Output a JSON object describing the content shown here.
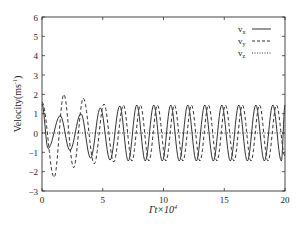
{
  "chart_data": {
    "type": "line",
    "title": "",
    "xlabel": "Γt×10⁴",
    "ylabel": "Velocity(ms⁻¹)",
    "xlim": [
      0,
      20
    ],
    "ylim": [
      -3,
      6
    ],
    "x_ticks": [
      "0",
      "5",
      "10",
      "15",
      "20"
    ],
    "y_ticks": [
      "-3",
      "-2",
      "-1",
      "0",
      "1",
      "2",
      "3",
      "4",
      "5",
      "6"
    ],
    "grid": false,
    "legend_position": "upper right",
    "series": [
      {
        "name": "vx",
        "style": "solid",
        "description": "oscillation starting ~1.5, early amplitude ~0.9, growing to ~1.45, period ~1.35",
        "points": [
          [
            0,
            1.5
          ],
          [
            0.5,
            -0.8
          ],
          [
            1.5,
            0.9
          ],
          [
            2.3,
            -0.9
          ],
          [
            3.2,
            1.0
          ],
          [
            4.0,
            -1.3
          ],
          [
            4.8,
            1.3
          ],
          [
            5.6,
            -1.4
          ],
          [
            6.4,
            1.4
          ],
          [
            7.1,
            -1.45
          ],
          [
            7.8,
            1.45
          ],
          [
            8.5,
            -1.45
          ],
          [
            9.2,
            1.45
          ],
          [
            9.9,
            -1.45
          ],
          [
            10.6,
            1.45
          ],
          [
            11.3,
            -1.45
          ],
          [
            12.0,
            1.45
          ],
          [
            12.7,
            -1.45
          ],
          [
            13.4,
            1.45
          ],
          [
            14.1,
            -1.45
          ],
          [
            14.8,
            1.45
          ],
          [
            15.5,
            -1.45
          ],
          [
            16.2,
            1.45
          ],
          [
            16.9,
            -1.45
          ],
          [
            17.6,
            1.45
          ],
          [
            18.3,
            -1.45
          ],
          [
            19.0,
            1.45
          ],
          [
            19.7,
            -1.45
          ],
          [
            20,
            1.45
          ]
        ]
      },
      {
        "name": "vy",
        "style": "dashed",
        "description": "starts ~1.6, large early swings (-2.3 / 2.0), settles to ~1.45 amplitude lagging vx",
        "points": [
          [
            0,
            1.6
          ],
          [
            1.0,
            -2.3
          ],
          [
            1.8,
            2.0
          ],
          [
            2.6,
            -1.8
          ],
          [
            3.4,
            1.8
          ],
          [
            4.3,
            -1.6
          ],
          [
            5.1,
            1.5
          ],
          [
            5.9,
            -1.5
          ],
          [
            6.7,
            1.45
          ],
          [
            7.4,
            -1.45
          ],
          [
            8.1,
            1.45
          ],
          [
            8.8,
            -1.45
          ],
          [
            9.5,
            1.45
          ],
          [
            10.2,
            -1.45
          ],
          [
            10.9,
            1.45
          ],
          [
            11.6,
            -1.45
          ],
          [
            12.3,
            1.45
          ],
          [
            13.0,
            -1.45
          ],
          [
            13.7,
            1.45
          ],
          [
            14.4,
            -1.45
          ],
          [
            15.1,
            1.45
          ],
          [
            15.8,
            -1.45
          ],
          [
            16.5,
            1.45
          ],
          [
            17.2,
            -1.45
          ],
          [
            17.9,
            1.45
          ],
          [
            18.6,
            -1.45
          ],
          [
            19.3,
            1.45
          ],
          [
            20,
            -1.2
          ]
        ]
      },
      {
        "name": "vz",
        "style": "dotted",
        "description": "flat near zero",
        "points": [
          [
            0,
            0
          ],
          [
            20,
            0
          ]
        ]
      }
    ]
  },
  "legend": {
    "items": [
      {
        "label": "v",
        "sub": "x"
      },
      {
        "label": "v",
        "sub": "y"
      },
      {
        "label": "v",
        "sub": "z"
      }
    ]
  },
  "axes": {
    "xlabel_main": "Γt×10",
    "xlabel_sup": "4",
    "ylabel_main": "Velocity(ms",
    "ylabel_sup": "-1",
    "ylabel_close": ")"
  }
}
